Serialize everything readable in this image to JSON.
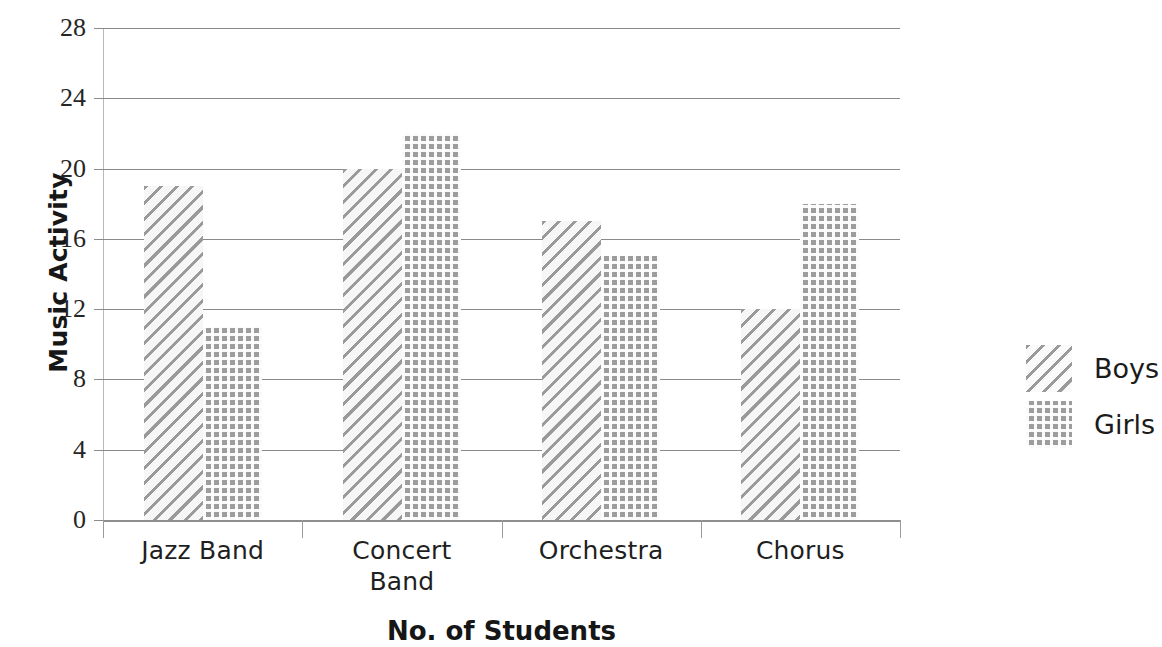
{
  "chart_data": {
    "type": "bar",
    "title": "",
    "subtitle": "",
    "xlabel": "No. of Students",
    "ylabel": "Music Activity",
    "categories": [
      "Jazz Band",
      "Concert Band",
      "Orchestra",
      "Chorus"
    ],
    "category_lines": [
      [
        "Jazz Band"
      ],
      [
        "Concert",
        "Band"
      ],
      [
        "Orchestra"
      ],
      [
        "Chorus"
      ]
    ],
    "series": [
      {
        "name": "Boys",
        "values": [
          19,
          20,
          17,
          12
        ]
      },
      {
        "name": "Girls",
        "values": [
          11,
          22,
          15,
          18
        ]
      }
    ],
    "ylim": [
      0,
      28
    ],
    "yticks": [
      0,
      4,
      8,
      12,
      16,
      20,
      24,
      28
    ],
    "ytick_labels": [
      "0",
      "4",
      "8",
      "12",
      "16",
      "20",
      "24",
      "28"
    ],
    "grid": true,
    "grid_axis": "y",
    "legend_position": "right",
    "legend": [
      {
        "label": "Boys",
        "pattern": "diagonal-hatch"
      },
      {
        "label": "Girls",
        "pattern": "dotted-grid"
      }
    ],
    "colors": {
      "bar_fill": "#9d9d9d",
      "hatch": "#9a9a9a",
      "gridline": "#8a8a8a",
      "text": "#1a1a1a",
      "background": "#ffffff"
    }
  }
}
